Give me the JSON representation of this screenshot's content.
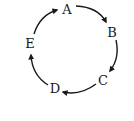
{
  "diagram": {
    "type": "cycle",
    "nodes": [
      {
        "id": "A",
        "label": "A",
        "x": 67,
        "y": 9
      },
      {
        "id": "B",
        "label": "B",
        "x": 112,
        "y": 32
      },
      {
        "id": "C",
        "label": "C",
        "x": 103,
        "y": 80
      },
      {
        "id": "D",
        "label": "D",
        "x": 55,
        "y": 88
      },
      {
        "id": "E",
        "label": "E",
        "x": 30,
        "y": 43
      }
    ],
    "edges": [
      {
        "from": "A",
        "to": "B"
      },
      {
        "from": "B",
        "to": "C"
      },
      {
        "from": "C",
        "to": "D"
      },
      {
        "from": "D",
        "to": "E"
      },
      {
        "from": "E",
        "to": "A"
      }
    ],
    "stroke_color": "#1a1a1a"
  }
}
